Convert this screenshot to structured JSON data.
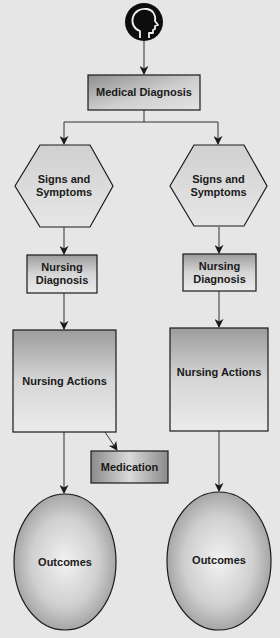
{
  "diagram": {
    "colors": {
      "background": "#e6e6e6",
      "box_fill_dark": "#9a9a9a",
      "box_fill_light": "#e2e2e2",
      "stroke": "#1a1a1a",
      "connector": "#333333",
      "head_icon": "#0d0d0d"
    },
    "nodes": {
      "head": {
        "icon": "head-profile-icon"
      },
      "medical_diagnosis": {
        "label": "Medical Diagnosis"
      },
      "left": {
        "signs": {
          "line1": "Signs and",
          "line2": "Symptoms"
        },
        "nursing_diagnosis": {
          "line1": "Nursing",
          "line2": "Diagnosis"
        },
        "nursing_actions": {
          "label": "Nursing Actions"
        },
        "medication": {
          "label": "Medication"
        },
        "outcomes": {
          "label": "Outcomes"
        }
      },
      "right": {
        "signs": {
          "line1": "Signs and",
          "line2": "Symptoms"
        },
        "nursing_diagnosis": {
          "line1": "Nursing",
          "line2": "Diagnosis"
        },
        "nursing_actions": {
          "label": "Nursing Actions"
        },
        "outcomes": {
          "label": "Outcomes"
        }
      }
    },
    "edges": [
      [
        "head",
        "medical_diagnosis"
      ],
      [
        "medical_diagnosis",
        "left.signs"
      ],
      [
        "medical_diagnosis",
        "right.signs"
      ],
      [
        "left.signs",
        "left.nursing_diagnosis"
      ],
      [
        "right.signs",
        "right.nursing_diagnosis"
      ],
      [
        "left.nursing_diagnosis",
        "left.nursing_actions"
      ],
      [
        "right.nursing_diagnosis",
        "right.nursing_actions"
      ],
      [
        "left.nursing_actions",
        "left.medication"
      ],
      [
        "left.nursing_actions",
        "left.outcomes"
      ],
      [
        "right.nursing_actions",
        "right.outcomes"
      ]
    ]
  }
}
